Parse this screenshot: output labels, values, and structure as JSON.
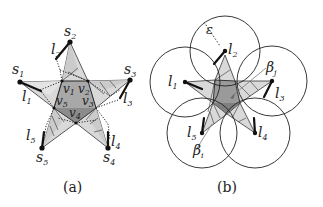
{
  "panel_a": {
    "caption": "(a)",
    "outer_points": [
      {
        "name": "s",
        "sub": "1"
      },
      {
        "name": "s",
        "sub": "2"
      },
      {
        "name": "s",
        "sub": "3"
      },
      {
        "name": "s",
        "sub": "4"
      },
      {
        "name": "s",
        "sub": "5"
      }
    ],
    "segments": [
      {
        "name": "l",
        "sub": "1"
      },
      {
        "name": "l",
        "sub": "2"
      },
      {
        "name": "l",
        "sub": "3"
      },
      {
        "name": "l",
        "sub": "4"
      },
      {
        "name": "l",
        "sub": "5"
      }
    ],
    "inner_vertices": [
      {
        "name": "v",
        "sub": "1"
      },
      {
        "name": "v",
        "sub": "2"
      },
      {
        "name": "v",
        "sub": "3"
      },
      {
        "name": "v",
        "sub": "4"
      },
      {
        "name": "v",
        "sub": "5"
      }
    ]
  },
  "panel_b": {
    "caption": "(b)",
    "epsilon": "ε",
    "segments": [
      {
        "name": "l",
        "sub": "1"
      },
      {
        "name": "l",
        "sub": "2"
      },
      {
        "name": "l",
        "sub": "3"
      },
      {
        "name": "l",
        "sub": "4"
      },
      {
        "name": "l",
        "sub": "5"
      }
    ],
    "betas": [
      {
        "name": "β",
        "sub": "j"
      },
      {
        "name": "β",
        "sub": "i"
      }
    ]
  },
  "colors": {
    "light_fill": "#dcdcdc",
    "mid_fill": "#c4c4c4",
    "dark_fill": "#8a8a8a",
    "stroke": "#222222"
  }
}
